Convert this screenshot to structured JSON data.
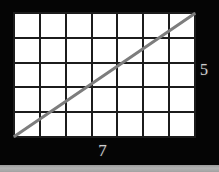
{
  "figure": {
    "background_color": "#050505",
    "title": "",
    "grid": {
      "columns": 7,
      "rows": 5,
      "cell_fill": "#ffffff",
      "line_color": "#1c1c1c",
      "line_width_px": 2
    },
    "diagonal": {
      "description": "straight line from bottom-left corner of grid to top-right corner of grid",
      "color": "#7d7d7d",
      "width_px": 3,
      "from": [
        0,
        5
      ],
      "to": [
        7,
        0
      ]
    },
    "labels": {
      "x_label": "7",
      "y_label": "5",
      "label_color": "#cfcfcf"
    },
    "bottom_strip_color": "#a8a8a8"
  },
  "chart_data": {
    "type": "line",
    "title": "",
    "xlabel": "7",
    "ylabel": "5",
    "x": [
      0,
      7
    ],
    "y": [
      0,
      5
    ],
    "xlim": [
      0,
      7
    ],
    "ylim": [
      0,
      5
    ],
    "grid": true,
    "grid_columns": 7,
    "grid_rows": 5,
    "legend": "none",
    "series": [
      {
        "name": "diagonal",
        "x": [
          0,
          7
        ],
        "y": [
          0,
          5
        ],
        "color": "#7d7d7d"
      }
    ]
  }
}
